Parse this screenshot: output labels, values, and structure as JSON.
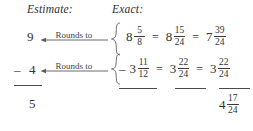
{
  "figure": {
    "type": "mixed-number-subtraction-worksheet",
    "background_color": "#ffffff",
    "ink_color": "#333333"
  },
  "headings": {
    "estimate": "Estimate:",
    "exact": "Exact:"
  },
  "arrows": {
    "label_top": "Rounds to",
    "label_bottom": "Rounds to",
    "direction": "left"
  },
  "estimate_column": {
    "minuend": "9",
    "subtrahend_sign": "–",
    "subtrahend": "4",
    "difference": "5"
  },
  "braces": {
    "top": "{",
    "bottom": "{"
  },
  "exact_column": {
    "row1": {
      "original": {
        "whole": "8",
        "numerator": "5",
        "denominator": "8"
      },
      "equals1": "=",
      "common_denominator": {
        "whole": "8",
        "numerator": "15",
        "denominator": "24"
      },
      "equals2": "=",
      "regrouped": {
        "whole": "7",
        "numerator": "39",
        "denominator": "24"
      }
    },
    "row2": {
      "original": {
        "sign": "–",
        "whole": "3",
        "numerator": "11",
        "denominator": "12"
      },
      "equals1": "=",
      "common_denominator": {
        "whole": "3",
        "numerator": "22",
        "denominator": "24"
      },
      "equals2": "=",
      "regrouped": {
        "whole": "3",
        "numerator": "22",
        "denominator": "24"
      }
    },
    "answer": {
      "whole": "4",
      "numerator": "17",
      "denominator": "24"
    }
  }
}
